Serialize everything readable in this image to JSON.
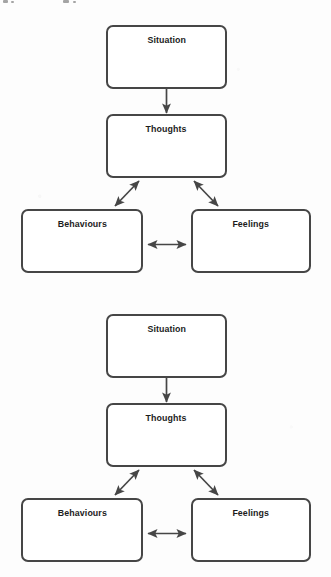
{
  "document": {
    "title": "Cognitive Behavioural Cycle Diagram",
    "background_color": "#fdfdfd",
    "stroke_color": "#464646",
    "text_color": "#1c1c1c",
    "node_fill": "#ffffff"
  },
  "diagrams": [
    {
      "id": "diagram-top",
      "nodes": {
        "situation": "Situation",
        "thoughts": "Thoughts",
        "behaviours": "Behaviours",
        "feelings": "Feelings"
      },
      "edges": [
        {
          "from": "situation",
          "to": "thoughts",
          "arrow": "single",
          "direction": "down"
        },
        {
          "from": "thoughts",
          "to": "behaviours",
          "arrow": "double",
          "direction": "diagonal-left"
        },
        {
          "from": "thoughts",
          "to": "feelings",
          "arrow": "double",
          "direction": "diagonal-right"
        },
        {
          "from": "behaviours",
          "to": "feelings",
          "arrow": "double",
          "direction": "horizontal"
        }
      ]
    },
    {
      "id": "diagram-bottom",
      "nodes": {
        "situation": "Situation",
        "thoughts": "Thoughts",
        "behaviours": "Behaviours",
        "feelings": "Feelings"
      },
      "edges": [
        {
          "from": "situation",
          "to": "thoughts",
          "arrow": "single",
          "direction": "down"
        },
        {
          "from": "thoughts",
          "to": "behaviours",
          "arrow": "double",
          "direction": "diagonal-left"
        },
        {
          "from": "thoughts",
          "to": "feelings",
          "arrow": "double",
          "direction": "diagonal-right"
        },
        {
          "from": "behaviours",
          "to": "feelings",
          "arrow": "double",
          "direction": "horizontal"
        }
      ]
    }
  ]
}
